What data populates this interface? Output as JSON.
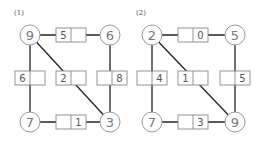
{
  "graphs": [
    {
      "label": "(1)",
      "nodes": [
        {
          "id": "tl",
          "value": "9",
          "x": 30,
          "y": 35
        },
        {
          "id": "tr",
          "value": "6",
          "x": 110,
          "y": 35
        },
        {
          "id": "bl",
          "value": "7",
          "x": 30,
          "y": 122
        },
        {
          "id": "br",
          "value": "3",
          "x": 110,
          "y": 122
        }
      ],
      "edges": [
        {
          "from": "tl",
          "to": "tr",
          "box": {
            "x": 56,
            "y": 28,
            "left": "5",
            "right": ""
          }
        },
        {
          "from": "tl",
          "to": "bl",
          "box": {
            "x": 15,
            "y": 71,
            "left": "6",
            "right": ""
          }
        },
        {
          "from": "tl",
          "to": "br",
          "box": {
            "x": 56,
            "y": 71,
            "left": "2",
            "right": ""
          }
        },
        {
          "from": "tr",
          "to": "br",
          "box": {
            "x": 97,
            "y": 71,
            "left": "",
            "right": "8"
          }
        },
        {
          "from": "bl",
          "to": "br",
          "box": {
            "x": 56,
            "y": 115,
            "left": "",
            "right": "1"
          }
        }
      ]
    },
    {
      "label": "(2)",
      "nodes": [
        {
          "id": "tl",
          "value": "2",
          "x": 152,
          "y": 35
        },
        {
          "id": "tr",
          "value": "5",
          "x": 235,
          "y": 35
        },
        {
          "id": "bl",
          "value": "7",
          "x": 152,
          "y": 122
        },
        {
          "id": "br",
          "value": "9",
          "x": 235,
          "y": 122
        }
      ],
      "edges": [
        {
          "from": "tl",
          "to": "tr",
          "box": {
            "x": 178,
            "y": 28,
            "left": "",
            "right": "0"
          }
        },
        {
          "from": "tl",
          "to": "bl",
          "box": {
            "x": 137,
            "y": 71,
            "left": "",
            "right": "4"
          }
        },
        {
          "from": "tl",
          "to": "br",
          "box": {
            "x": 178,
            "y": 71,
            "left": "1",
            "right": ""
          }
        },
        {
          "from": "tr",
          "to": "br",
          "box": {
            "x": 220,
            "y": 71,
            "left": "",
            "right": "5"
          }
        },
        {
          "from": "bl",
          "to": "br",
          "box": {
            "x": 178,
            "y": 115,
            "left": "",
            "right": "3"
          }
        }
      ]
    }
  ],
  "style": {
    "line": "#222222",
    "node_stroke": "#999999",
    "box_stroke": "#888888",
    "text": "#666666"
  }
}
